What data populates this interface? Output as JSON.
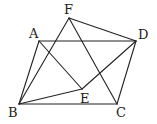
{
  "diagram": {
    "title": "",
    "points": {
      "A": {
        "x": 39,
        "y": 41,
        "label": "A",
        "lx": 29,
        "ly": 38
      },
      "B": {
        "x": 19,
        "y": 104,
        "label": "B",
        "lx": 8,
        "ly": 117
      },
      "C": {
        "x": 117,
        "y": 104,
        "label": "C",
        "lx": 116,
        "ly": 117
      },
      "D": {
        "x": 136,
        "y": 41,
        "label": "D",
        "lx": 138,
        "ly": 39
      },
      "E": {
        "x": 82,
        "y": 89,
        "label": "E",
        "lx": 80,
        "ly": 103
      },
      "F": {
        "x": 69,
        "y": 18,
        "label": "F",
        "lx": 64,
        "ly": 14
      }
    },
    "segments": [
      [
        "A",
        "D"
      ],
      [
        "A",
        "B"
      ],
      [
        "B",
        "C"
      ],
      [
        "C",
        "D"
      ],
      [
        "A",
        "E"
      ],
      [
        "B",
        "E"
      ],
      [
        "D",
        "E"
      ],
      [
        "B",
        "F"
      ],
      [
        "F",
        "D"
      ],
      [
        "F",
        "C"
      ]
    ]
  }
}
